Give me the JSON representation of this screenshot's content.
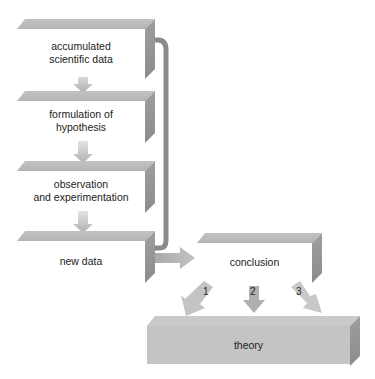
{
  "diagram": {
    "steps": [
      {
        "id": "accumulated",
        "label_line1": "accumulated",
        "label_line2": "scientific data"
      },
      {
        "id": "formulation",
        "label_line1": "formulation of",
        "label_line2": "hypothesis"
      },
      {
        "id": "observation",
        "label_line1": "observation",
        "label_line2": "and experimentation"
      },
      {
        "id": "new_data",
        "label_line1": "new data",
        "label_line2": ""
      }
    ],
    "conclusion": {
      "label": "conclusion"
    },
    "theory": {
      "label": "theory"
    },
    "outcome_arrows": [
      {
        "number": "1"
      },
      {
        "number": "2"
      },
      {
        "number": "3"
      }
    ],
    "colors": {
      "top_face": "#bcbcbc",
      "side_face": "#959595",
      "arrow": "#b8b8b8",
      "feedback_arrow": "#8a8a8a",
      "theory_front": "#c4c4c4"
    },
    "edges": [
      {
        "from": "accumulated",
        "to": "formulation"
      },
      {
        "from": "formulation",
        "to": "observation"
      },
      {
        "from": "observation",
        "to": "new_data"
      },
      {
        "from": "new_data",
        "to": "accumulated",
        "type": "feedback"
      },
      {
        "from": "new_data",
        "to": "conclusion"
      },
      {
        "from": "conclusion",
        "to": "theory",
        "labels": [
          "1",
          "2",
          "3"
        ]
      }
    ]
  }
}
